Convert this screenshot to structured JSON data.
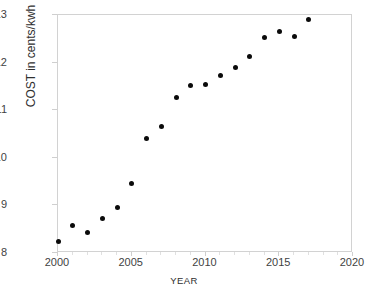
{
  "chart_data": {
    "type": "scatter",
    "title": "",
    "xlabel": "YEAR",
    "ylabel": "COST in cents/kwh",
    "xlim": [
      2000,
      2020
    ],
    "ylim": [
      8,
      13
    ],
    "xticks": [
      2000,
      2005,
      2010,
      2015,
      2020
    ],
    "yticks": [
      8,
      9,
      10,
      11,
      12,
      13
    ],
    "xtick_labels": [
      "2000",
      "2005",
      "2010",
      "2015",
      "2020"
    ],
    "ytick_labels": [
      "8",
      "9",
      "10",
      "11",
      "12",
      "13"
    ],
    "x_minor_tick_interval": 1,
    "grid": false,
    "legend": null,
    "marker": {
      "shape": "circle",
      "color": "#0b0b0b",
      "size_px": 5
    },
    "series": [
      {
        "name": "COST in cents/kwh",
        "x": [
          2000,
          2001,
          2002,
          2003,
          2004,
          2005,
          2006,
          2007,
          2008,
          2009,
          2010,
          2011,
          2012,
          2013,
          2014,
          2015,
          2016,
          2017
        ],
        "values": [
          8.24,
          8.58,
          8.44,
          8.72,
          8.95,
          9.45,
          10.4,
          10.65,
          11.26,
          11.51,
          11.54,
          11.72,
          11.9,
          12.12,
          12.53,
          12.65,
          12.55,
          12.9
        ]
      }
    ]
  },
  "axes": {
    "frame_color": "#d2d2d2",
    "background": "#ffffff"
  }
}
